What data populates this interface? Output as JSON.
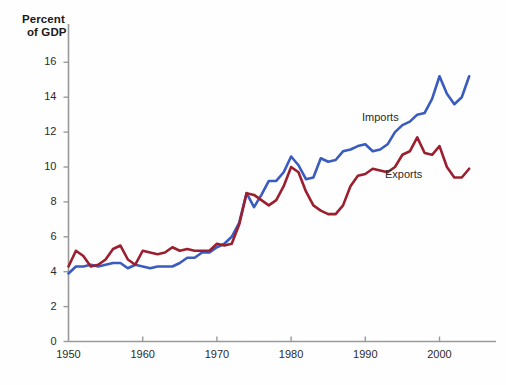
{
  "chart_data": {
    "type": "line",
    "title": "",
    "subtitle": "",
    "xlabel": "",
    "ylabel": "Percent of GDP",
    "ylabel_lines": [
      "Percent",
      "of GDP"
    ],
    "xlim": [
      1950,
      2004
    ],
    "ylim": [
      0,
      17
    ],
    "grid": false,
    "legend_position": "inline-annotation",
    "ytick_values": [
      0,
      2,
      4,
      6,
      8,
      10,
      12,
      14,
      16
    ],
    "ytick_labels": [
      "0",
      "2",
      "4",
      "6",
      "8",
      "10",
      "12",
      "14",
      "16"
    ],
    "xtick_values": [
      1950,
      1960,
      1970,
      1980,
      1990,
      2000
    ],
    "xtick_labels": [
      "1950",
      "1960",
      "1970",
      "1980",
      "1990",
      "2000"
    ],
    "x": [
      1950,
      1951,
      1952,
      1953,
      1954,
      1955,
      1956,
      1957,
      1958,
      1959,
      1960,
      1961,
      1962,
      1963,
      1964,
      1965,
      1966,
      1967,
      1968,
      1969,
      1970,
      1971,
      1972,
      1973,
      1974,
      1975,
      1976,
      1977,
      1978,
      1979,
      1980,
      1981,
      1982,
      1983,
      1984,
      1985,
      1986,
      1987,
      1988,
      1989,
      1990,
      1991,
      1992,
      1993,
      1994,
      1995,
      1996,
      1997,
      1998,
      1999,
      2000,
      2001,
      2002,
      2003,
      2004
    ],
    "series": [
      {
        "name": "Imports",
        "color": "#3a5bbf",
        "values": [
          3.9,
          4.3,
          4.3,
          4.4,
          4.3,
          4.4,
          4.5,
          4.5,
          4.2,
          4.4,
          4.3,
          4.2,
          4.3,
          4.3,
          4.3,
          4.5,
          4.8,
          4.8,
          5.1,
          5.1,
          5.4,
          5.6,
          6.0,
          6.8,
          8.5,
          7.7,
          8.4,
          9.2,
          9.2,
          9.7,
          10.6,
          10.1,
          9.3,
          9.4,
          10.5,
          10.3,
          10.4,
          10.9,
          11.0,
          11.2,
          11.3,
          10.9,
          11.0,
          11.3,
          12.0,
          12.4,
          12.6,
          13.0,
          13.1,
          13.9,
          15.2,
          14.2,
          13.6,
          14.0,
          15.2
        ]
      },
      {
        "name": "Exports",
        "color": "#9b1f2e",
        "values": [
          4.3,
          5.2,
          4.9,
          4.3,
          4.4,
          4.7,
          5.3,
          5.5,
          4.7,
          4.4,
          5.2,
          5.1,
          5.0,
          5.1,
          5.4,
          5.2,
          5.3,
          5.2,
          5.2,
          5.2,
          5.6,
          5.5,
          5.6,
          6.7,
          8.5,
          8.4,
          8.1,
          7.8,
          8.1,
          8.9,
          10.0,
          9.7,
          8.6,
          7.8,
          7.5,
          7.3,
          7.3,
          7.8,
          8.9,
          9.5,
          9.6,
          9.9,
          9.8,
          9.7,
          10.0,
          10.7,
          10.9,
          11.7,
          10.8,
          10.7,
          11.2,
          10.0,
          9.4,
          9.4,
          9.9
        ]
      }
    ],
    "annotations": [
      {
        "text": "Imports",
        "series": "Imports"
      },
      {
        "text": "Exports",
        "series": "Exports"
      }
    ],
    "colors": {
      "imports": "#3a5bbf",
      "exports": "#9b1f2e",
      "axis": "#9a9a9a",
      "text": "#2b2b2b",
      "background": "#fefefe"
    }
  }
}
